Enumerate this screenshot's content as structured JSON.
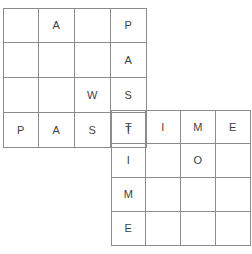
{
  "puzzle": {
    "title": "PASTIME crossword grid",
    "grid_line_color": "#8c8c8c",
    "letter_color": "#3f3f3f",
    "background_color": "#ffffff",
    "blocks": [
      {
        "name": "upper-left-block",
        "columns": 4,
        "rows": 4,
        "x": 3,
        "y": 8,
        "cell_width": 36,
        "cell_height": 35,
        "rows_data": [
          [
            "",
            "A",
            "",
            "P"
          ],
          [
            "",
            "",
            "",
            "A"
          ],
          [
            "",
            "",
            "W",
            "S"
          ],
          [
            "P",
            "A",
            "S",
            "T"
          ]
        ]
      },
      {
        "name": "lower-right-block",
        "columns": 4,
        "rows": 4,
        "x": 111,
        "y": 110,
        "cell_width": 35,
        "cell_height": 34,
        "rows_data": [
          [
            "T",
            "I",
            "M",
            "E"
          ],
          [
            "I",
            "",
            "O",
            ""
          ],
          [
            "M",
            "",
            "",
            ""
          ],
          [
            "E",
            "",
            "",
            ""
          ]
        ]
      }
    ],
    "words": {
      "across": "PASTIME",
      "down": "PASTIME"
    }
  }
}
